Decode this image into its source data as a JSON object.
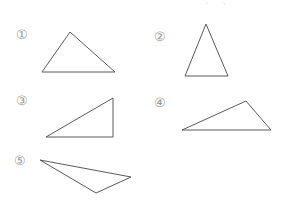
{
  "page": {
    "background_color": "#ffffff",
    "width": 290,
    "height": 200,
    "stroke_color": "#5a5a5a",
    "label_color": "#9a9a9a"
  },
  "top_cut_text": {
    "fragment": "( ... )"
  },
  "items": [
    {
      "label": "①",
      "label_x": 16,
      "label_y": 28,
      "shape": "triangle",
      "description": "scalene triangle, apex left of center, horizontal base",
      "points": "70,32 42,72 115,72"
    },
    {
      "label": "②",
      "label_x": 154,
      "label_y": 30,
      "shape": "triangle",
      "description": "tall isosceles triangle, horizontal base",
      "points": "206,24 185,76 228,76"
    },
    {
      "label": "③",
      "label_x": 16,
      "label_y": 94,
      "shape": "triangle",
      "description": "right triangle, right angle at bottom right",
      "points": "113,98 113,137 46,137"
    },
    {
      "label": "④",
      "label_x": 154,
      "label_y": 96,
      "shape": "triangle",
      "description": "flat obtuse triangle, apex right of center, horizontal base",
      "points": "246,101 182,130 271,130"
    },
    {
      "label": "⑤",
      "label_x": 14,
      "label_y": 154,
      "shape": "triangle",
      "description": "thin sliver triangle pointing left",
      "points": "40,160 131,177 96,193"
    }
  ]
}
